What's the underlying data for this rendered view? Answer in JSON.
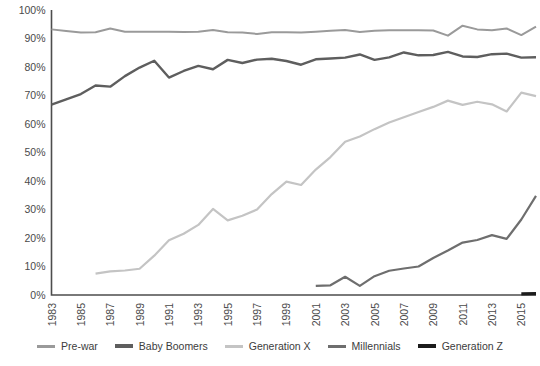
{
  "chart_data": {
    "type": "line",
    "title": "",
    "subtitle": "",
    "xlabel": "",
    "ylabel": "",
    "xlim": [
      1983,
      2016
    ],
    "ylim": [
      0,
      100
    ],
    "grid": false,
    "legend_position": "bottom",
    "y_ticks": [
      "0%",
      "10%",
      "20%",
      "30%",
      "40%",
      "50%",
      "60%",
      "70%",
      "80%",
      "90%",
      "100%"
    ],
    "y_tick_values": [
      0,
      10,
      20,
      30,
      40,
      50,
      60,
      70,
      80,
      90,
      100
    ],
    "x_ticks": [
      "1983",
      "1985",
      "1987",
      "1989",
      "1991",
      "1993",
      "1995",
      "1997",
      "1999",
      "2001",
      "2003",
      "2005",
      "2007",
      "2009",
      "2011",
      "2013",
      "2015"
    ],
    "x_tick_values": [
      1983,
      1985,
      1987,
      1989,
      1991,
      1993,
      1995,
      1997,
      1999,
      2001,
      2003,
      2005,
      2007,
      2009,
      2011,
      2013,
      2015
    ],
    "series": [
      {
        "name": "Pre-war",
        "color": "#9a9a9a",
        "width": 2.0,
        "x": [
          1983,
          1984,
          1985,
          1986,
          1987,
          1988,
          1989,
          1990,
          1991,
          1992,
          1993,
          1994,
          1995,
          1996,
          1997,
          1998,
          1999,
          2000,
          2001,
          2002,
          2003,
          2004,
          2005,
          2006,
          2007,
          2008,
          2009,
          2010,
          2011,
          2012,
          2013,
          2014,
          2015,
          2016
        ],
        "values": [
          93.2,
          92.6,
          92.1,
          92.2,
          93.5,
          92.4,
          92.4,
          92.4,
          92.4,
          92.3,
          92.4,
          93.0,
          92.2,
          92.1,
          91.6,
          92.2,
          92.2,
          92.1,
          92.4,
          92.7,
          93.0,
          92.3,
          92.7,
          92.9,
          92.9,
          92.9,
          92.8,
          91.0,
          94.5,
          93.2,
          92.9,
          93.5,
          91.2,
          94.2
        ]
      },
      {
        "name": "Baby Boomers",
        "color": "#5e5e5e",
        "width": 2.4,
        "x": [
          1983,
          1984,
          1985,
          1986,
          1987,
          1988,
          1989,
          1990,
          1991,
          1992,
          1993,
          1994,
          1995,
          1996,
          1997,
          1998,
          1999,
          2000,
          2001,
          2002,
          2003,
          2004,
          2005,
          2006,
          2007,
          2008,
          2009,
          2010,
          2011,
          2012,
          2013,
          2014,
          2015,
          2016
        ],
        "values": [
          66.8,
          68.6,
          70.5,
          73.5,
          73.1,
          76.8,
          79.8,
          82.2,
          76.3,
          78.6,
          80.4,
          79.2,
          82.5,
          81.4,
          82.6,
          82.9,
          82.1,
          80.8,
          82.7,
          83.0,
          83.3,
          84.4,
          82.5,
          83.4,
          85.1,
          84.1,
          84.2,
          85.3,
          83.7,
          83.5,
          84.5,
          84.7,
          83.3,
          83.4
        ]
      },
      {
        "name": "Generation X",
        "color": "#c4c4c4",
        "width": 2.2,
        "x": [
          1986,
          1987,
          1988,
          1989,
          1990,
          1991,
          1992,
          1993,
          1994,
          1995,
          1996,
          1997,
          1998,
          1999,
          2000,
          2001,
          2002,
          2003,
          2004,
          2005,
          2006,
          2007,
          2008,
          2009,
          2010,
          2011,
          2012,
          2013,
          2014,
          2015,
          2016
        ],
        "values": [
          7.5,
          8.3,
          8.6,
          9.2,
          13.8,
          19.2,
          21.5,
          24.6,
          30.2,
          26.2,
          27.8,
          30.0,
          35.4,
          39.8,
          38.6,
          44.0,
          48.4,
          53.8,
          55.6,
          58.2,
          60.5,
          62.4,
          64.2,
          66.0,
          68.2,
          66.7,
          67.8,
          66.9,
          64.4,
          71.0,
          69.8
        ]
      },
      {
        "name": "Millennials",
        "color": "#6e6e6e",
        "width": 2.2,
        "x": [
          2001,
          2002,
          2003,
          2004,
          2005,
          2006,
          2007,
          2008,
          2009,
          2010,
          2011,
          2012,
          2013,
          2014,
          2015,
          2016
        ],
        "values": [
          3.2,
          3.4,
          6.4,
          3.2,
          6.6,
          8.5,
          9.3,
          10.0,
          13.0,
          15.6,
          18.4,
          19.3,
          21.0,
          19.7,
          26.5,
          34.8
        ]
      },
      {
        "name": "Generation Z",
        "color": "#1c1c1c",
        "width": 3.2,
        "x": [
          2015,
          2016
        ],
        "values": [
          0.4,
          0.5
        ]
      }
    ]
  },
  "legend": {
    "items": [
      {
        "label": "Pre-war",
        "color": "#9a9a9a"
      },
      {
        "label": "Baby Boomers",
        "color": "#5e5e5e"
      },
      {
        "label": "Generation X",
        "color": "#c4c4c4"
      },
      {
        "label": "Millennials",
        "color": "#6e6e6e"
      },
      {
        "label": "Generation Z",
        "color": "#1c1c1c"
      }
    ]
  }
}
